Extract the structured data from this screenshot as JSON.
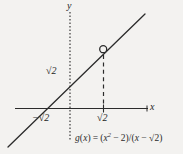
{
  "figure": {
    "name": "graph-of-g-of-x",
    "background_color": "#f3f2f0",
    "ink_color": "#2b2b2b",
    "width": 183,
    "height": 154
  },
  "axes": {
    "x_label": "x",
    "y_label": "y",
    "x_axis_style": "solid",
    "y_axis_style": "dotted",
    "origin": {
      "x": 70,
      "y": 108
    }
  },
  "ticks": {
    "y_sqrt2": "√2",
    "x_neg_sqrt2": "−√2",
    "x_sqrt2": "√2"
  },
  "curve": {
    "type": "line",
    "description": "y = x + √2 with removable discontinuity at x = √2",
    "slope": 1,
    "y_intercept_label": "√2",
    "x_intercept_label": "−√2",
    "hole": {
      "present": true,
      "style": "open-circle",
      "x_label": "√2",
      "pixel_x": 103,
      "pixel_y": 49
    },
    "dashed_drop_line": true
  },
  "equation": {
    "lhs": "g(x)",
    "equals": "=",
    "numerator": "(x² − 2)",
    "denominator": "(x − √2)",
    "full": "g(x) = (x² − 2)/(x − √2)",
    "parts": {
      "g": "g",
      "open_paren_1": "(",
      "var_1": "x",
      "close_paren_1": ")",
      "eq": "=",
      "open_paren_2": "(",
      "var_2": "x",
      "exponent": "2",
      "minus_1": "−",
      "two": "2",
      "close_paren_2": ")",
      "slash": "/",
      "open_paren_3": "(",
      "var_3": "x",
      "minus_2": "−",
      "radical": "√",
      "radicand": "2",
      "close_paren_3": ")"
    }
  }
}
